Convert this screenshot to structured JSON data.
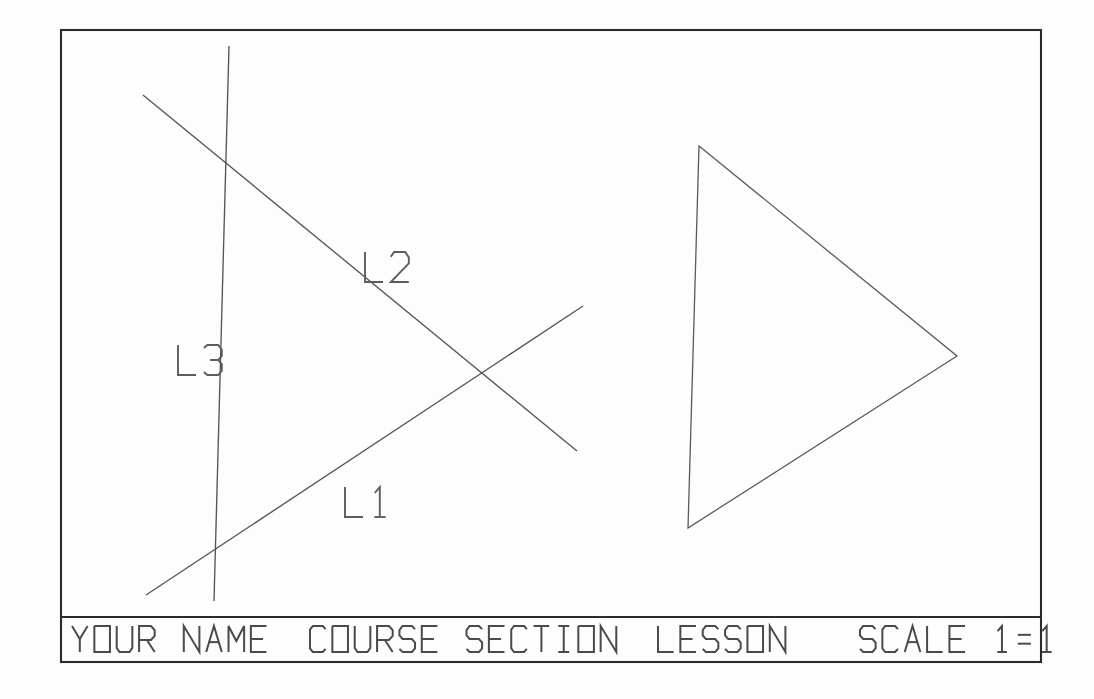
{
  "sheet": {
    "width": 1094,
    "height": 699,
    "background_color": "#fdfdfd",
    "ink_color": "#555555",
    "frame_color": "#2b2b2b"
  },
  "border": {
    "name": "drawing-border",
    "x1": 61,
    "y1": 30,
    "x2": 1041,
    "y2": 662
  },
  "title_block": {
    "divider_y": 617,
    "fields": [
      {
        "key": "name",
        "label": "YOUR NAME",
        "x": 72
      },
      {
        "key": "course",
        "label": "COURSE SECTION",
        "x": 310
      },
      {
        "key": "lesson",
        "label": "LESSON",
        "x": 658
      },
      {
        "key": "scale",
        "label": "SCALE 1=1",
        "x": 860
      }
    ],
    "full_text": "YOUR NAME  COURSE SECTION  LESSON   SCALE 1=1",
    "text_height": 26,
    "font_style": "cad-stick-monospace-square-o"
  },
  "drawing": {
    "lines": [
      {
        "id": "L1",
        "label": "L1",
        "x1": 146,
        "y1": 595,
        "x2": 583,
        "y2": 306,
        "label_x": 345,
        "label_y": 487,
        "description": "ascending diagonal line"
      },
      {
        "id": "L2",
        "label": "L2",
        "x1": 143,
        "y1": 95,
        "x2": 577,
        "y2": 451,
        "label_x": 365,
        "label_y": 252,
        "description": "descending diagonal line"
      },
      {
        "id": "L3",
        "label": "L3",
        "x1": 229,
        "y1": 46,
        "x2": 214,
        "y2": 601,
        "label_x": 178,
        "label_y": 345,
        "description": "near-vertical line"
      }
    ],
    "intersections": [
      {
        "name": "L1-L2-crossing",
        "x": 481,
        "y": 373
      },
      {
        "name": "L2-L3-crossing",
        "x": 227,
        "y": 163
      },
      {
        "name": "L1-L3-crossing",
        "x": 216,
        "y": 548
      }
    ],
    "triangle": {
      "id": "T1",
      "name": "triangle",
      "vertices": [
        {
          "name": "apex-top",
          "x": 699,
          "y": 146
        },
        {
          "name": "vertex-right",
          "x": 957,
          "y": 356
        },
        {
          "name": "vertex-left",
          "x": 688,
          "y": 528
        }
      ]
    },
    "label_text_height": 30
  }
}
